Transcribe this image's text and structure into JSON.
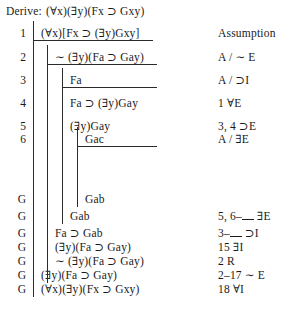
{
  "derive": {
    "label": "Derive:",
    "goal": "(∀x)(∃y)(Fx ⊃ Gxy)"
  },
  "columns": {
    "justification_header": "Assumption"
  },
  "rows": [
    {
      "number": "1",
      "formula": "(∀x)[Fx ⊃ (∃y)Gxy]",
      "justification": "Assumption",
      "depth": 1
    },
    {
      "number": "2",
      "formula": "∼ (∃y)(Fa ⊃ Gay)",
      "justification": "A / ∼ E",
      "depth": 2
    },
    {
      "number": "3",
      "formula": "Fa",
      "justification": "A / ⊃I",
      "depth": 3
    },
    {
      "number": "4",
      "formula": "Fa ⊃ (∃y)Gay",
      "justification": "1 ∀E",
      "depth": 3
    },
    {
      "number": "5",
      "formula": "(∃y)Gay",
      "justification": "3, 4 ⊃E",
      "depth": 3
    },
    {
      "number": "6",
      "formula": "Gac",
      "justification": "A / ∃E",
      "depth": 4
    },
    {
      "number": "G",
      "formula": "Gab",
      "justification": "",
      "depth": 4
    },
    {
      "number": "G",
      "formula": "Gab",
      "justification": "5, 6–__ ∃E",
      "depth": 3
    },
    {
      "number": "G",
      "formula": "Fa ⊃ Gab",
      "justification": "3–__ ⊃I",
      "depth": 2
    },
    {
      "number": "G",
      "formula": "(∃y)(Fa ⊃ Gay)",
      "justification": "15 ∃I",
      "depth": 2
    },
    {
      "number": "G",
      "formula": "∼ (∃y)(Fa ⊃ Gay)",
      "justification": "2 R",
      "depth": 2
    },
    {
      "number": "G",
      "formula": "(∃y)(Fa ⊃ Gay)",
      "justification": "2–17 ∼ E",
      "depth": 1
    },
    {
      "number": "G",
      "formula": "(∀x)(∃y)(Fx ⊃ Gxy)",
      "justification": "18 ∀I",
      "depth": 1
    }
  ]
}
